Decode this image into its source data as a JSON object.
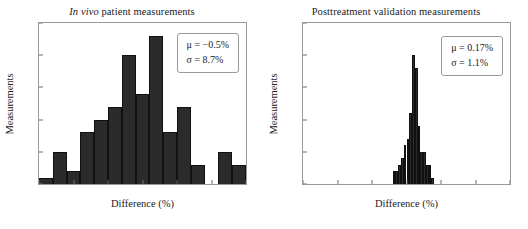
{
  "figure": {
    "width": 528,
    "height": 229,
    "bar_color": "#2b2b2b",
    "axis_color": "#9a9a9a"
  },
  "panels": [
    {
      "id": "in-vivo-panel",
      "title_italic": "In vivo",
      "title_rest": " patient measurements",
      "title_full": "In vivo patient measurements",
      "stats": {
        "mu": "μ = −0.5%",
        "sigma": "σ = 8.7%"
      }
    },
    {
      "id": "posttreatment-panel",
      "title_italic": "",
      "title_rest": "Posttreatment validation measurements",
      "title_full": "Posttreatment validation measurements",
      "stats": {
        "mu": "μ = 0.17%",
        "sigma": "σ = 1.1%"
      }
    }
  ],
  "chart_data": [
    {
      "type": "bar",
      "id": "in-vivo-histogram",
      "title": "In vivo patient measurements",
      "xlabel": "Difference (%)",
      "ylabel": "Measurements",
      "xlim": [
        -15,
        15
      ],
      "ylim": [
        0,
        25
      ],
      "xticks": [
        -15,
        -10,
        -5,
        0,
        5,
        10,
        15
      ],
      "xticklabels": [
        "−15",
        "−10",
        "−5",
        "0",
        "5",
        "10",
        "15"
      ],
      "yticks": [
        0,
        5,
        10,
        15,
        20,
        25
      ],
      "yticklabels": [
        "0",
        "5",
        "10",
        "15",
        "20",
        "25"
      ],
      "grid": false,
      "bin_width": 2,
      "bin_edges": [
        -15,
        -13,
        -11,
        -9,
        -7,
        -5,
        -3,
        -1,
        1,
        3,
        5,
        7,
        9,
        11,
        13,
        15
      ],
      "bin_centers": [
        -14,
        -12,
        -10,
        -8,
        -6,
        -4,
        -2,
        0,
        2,
        4,
        6,
        8,
        10,
        12,
        14
      ],
      "values": [
        1,
        5,
        2,
        8,
        10,
        12,
        20,
        14,
        23,
        8,
        12,
        3,
        0,
        5,
        3
      ],
      "annotations": [
        "μ = −0.5%",
        "σ = 8.7%"
      ],
      "legend_position": "upper-right"
    },
    {
      "type": "bar",
      "id": "posttreatment-histogram",
      "title": "Posttreatment validation measurements",
      "xlabel": "Difference (%)",
      "ylabel": "Measurements",
      "xlim": [
        -15,
        15
      ],
      "ylim": [
        0,
        25
      ],
      "xticks": [
        -15,
        -10,
        -5,
        0,
        5,
        10,
        15
      ],
      "xticklabels": [
        "−15",
        "−10",
        "−5",
        "0",
        "5",
        "10",
        "15"
      ],
      "yticks": [
        0,
        5,
        10,
        15,
        20,
        25
      ],
      "yticklabels": [
        "0",
        "5",
        "10",
        "15",
        "20",
        "25"
      ],
      "grid": false,
      "bin_width": 0.4,
      "bin_edges": [
        -2.0,
        -1.6,
        -1.2,
        -0.8,
        -0.4,
        0.0,
        0.4,
        0.8,
        1.2,
        1.6,
        2.0,
        2.4,
        2.8,
        3.2,
        3.6,
        4.0
      ],
      "bin_centers": [
        -1.8,
        -1.4,
        -1.0,
        -0.6,
        -0.2,
        0.2,
        0.6,
        1.0,
        1.4,
        1.8,
        2.2,
        2.6,
        3.0,
        3.4,
        3.8
      ],
      "values": [
        2,
        2,
        3,
        4,
        6,
        7,
        11,
        20,
        18,
        9,
        5,
        5,
        3,
        3,
        1
      ],
      "annotations": [
        "μ = 0.17%",
        "σ = 1.1%"
      ],
      "legend_position": "upper-right"
    }
  ]
}
